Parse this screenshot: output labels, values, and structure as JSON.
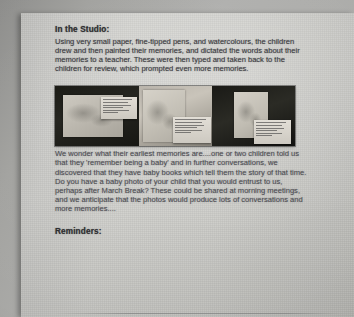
{
  "document": {
    "type": "scanned-newsletter-page",
    "sections": {
      "studio": {
        "heading": "In the Studio:",
        "paragraph": "Using very small paper, fine-tipped pens, and watercolours, the children drew and then painted their memories, and dictated the words about their memories to a teacher. These were then typed and taken back to the children for review, which prompted even more memories."
      },
      "photo_strip": {
        "name": "children-artwork-photo-strip",
        "panel_count": 3,
        "panels": [
          {
            "label": "panel-1-drawing-with-caption-card",
            "caption_card": true
          },
          {
            "label": "panel-2-drawing-with-caption-card",
            "caption_card": true
          },
          {
            "label": "panel-3-drawing-with-caption-card",
            "caption_card": true
          }
        ]
      },
      "memories": {
        "paragraph": "We wonder what their earliest memories are....one or two children told us that they 'remember being a baby' and in further conversations, we discovered that they have baby books which tell them the story of that time. Do you have a baby photo of your child that you would entrust to us, perhaps after March Break? These could be shared at morning meetings, and we anticipate that the photos would produce lots of conversations and more memories...."
      },
      "reminders": {
        "heading": "Reminders:"
      }
    }
  }
}
